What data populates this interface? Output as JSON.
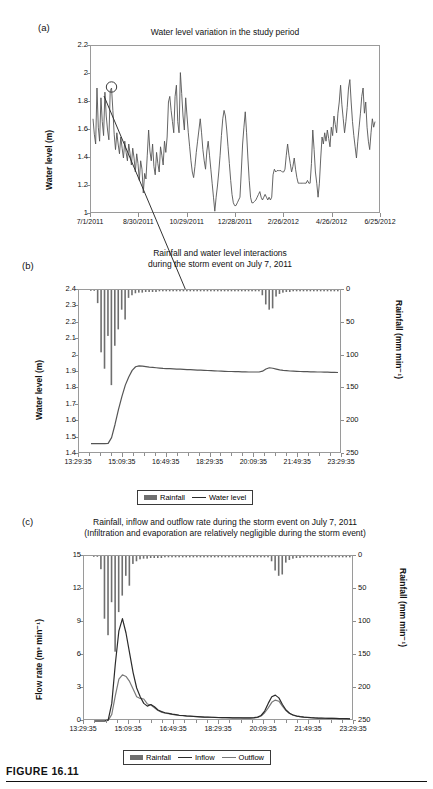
{
  "figure": {
    "caption": "FIGURE 16.11"
  },
  "panels": {
    "a": {
      "letter": "(a)",
      "title": "Water level variation in the study period",
      "ylabel": "Water level (m)",
      "yticks": [
        "1",
        "1.2",
        "1.4",
        "1.6",
        "1.8",
        "2",
        "2.2"
      ],
      "xticks": [
        "7/1/2011",
        "8/30/2011",
        "10/29/2011",
        "12/28/2011",
        "2/26/2012",
        "4/26/2012",
        "6/25/2012"
      ],
      "annotation": "circle-marker-highlight"
    },
    "b": {
      "letter": "(b)",
      "title_line1": "Rainfall and water level interactions",
      "title_line2": "during the storm event on July 7, 2011",
      "ylabel_left": "Water level (m)",
      "ylabel_right": "Rainfall (mm min⁻¹)",
      "yticks_left": [
        "1.4",
        "1.5",
        "1.6",
        "1.7",
        "1.8",
        "1.9",
        "2",
        "2.1",
        "2.2",
        "2.3",
        "2.4"
      ],
      "yticks_right": [
        "0",
        "50",
        "100",
        "150",
        "200",
        "250"
      ],
      "xticks": [
        "13:29:35",
        "15:09:35",
        "16:49:35",
        "18:29:35",
        "20:09:35",
        "21:49:35",
        "23:29:35"
      ],
      "legend": [
        "Rainfall",
        "Water level"
      ]
    },
    "c": {
      "letter": "(c)",
      "title_line1": "Rainfall, inflow and outflow rate during the storm event on July 7, 2011",
      "title_line2": "(Infiltration and evaporation are relatively negligible during the storm event)",
      "ylabel_left": "Flow rate (m³ min⁻¹)",
      "ylabel_right": "Rainfall (mm min⁻¹)",
      "yticks_left": [
        "0",
        "3",
        "6",
        "9",
        "12",
        "15"
      ],
      "yticks_right": [
        "0",
        "50",
        "100",
        "150",
        "200",
        "250"
      ],
      "xticks": [
        "13:29:35",
        "15:09:35",
        "16:49:35",
        "18:29:35",
        "20:09:35",
        "21:49:35",
        "23:29:35"
      ],
      "legend": [
        "Rainfall",
        "Inflow",
        "Outflow"
      ]
    }
  },
  "colors": {
    "series_line": "#555555",
    "rain_bar": "#6f6f6f",
    "inflow": "#2b2b2b",
    "outflow": "#7a7a7a",
    "axis": "#8d8d8d"
  },
  "chart_data": [
    {
      "type": "line",
      "panel": "a",
      "title": "Water level variation in the study period",
      "xlabel": "",
      "ylabel": "Water level (m)",
      "ylim": [
        1,
        2.2
      ],
      "yticks": [
        1,
        1.2,
        1.4,
        1.6,
        1.8,
        2,
        2.2
      ],
      "xtick_labels": [
        "7/1/2011",
        "8/30/2011",
        "10/29/2011",
        "12/28/2011",
        "2/26/2012",
        "4/26/2012",
        "6/25/2012"
      ],
      "grid": false,
      "legend": null,
      "series": [
        {
          "name": "Water level",
          "values": [
            1.68,
            1.57,
            1.5,
            1.9,
            1.62,
            1.52,
            1.83,
            1.66,
            1.56,
            1.87,
            1.7,
            1.6,
            1.53,
            1.88,
            1.9,
            1.74,
            1.57,
            1.46,
            1.58,
            1.5,
            1.43,
            1.55,
            1.47,
            1.4,
            1.52,
            1.44,
            1.38,
            1.5,
            1.43,
            1.35,
            1.47,
            1.4,
            1.3,
            1.43,
            1.36,
            1.24,
            1.38,
            1.32,
            1.15,
            1.29,
            1.25,
            1.42,
            1.6,
            1.45,
            1.38,
            1.5,
            1.34,
            1.28,
            1.44,
            1.36,
            1.3,
            1.48,
            1.42,
            1.35,
            1.52,
            1.44,
            1.55,
            1.8,
            1.84,
            1.74,
            1.66,
            1.58,
            1.84,
            1.92,
            1.66,
            1.58,
            2.01,
            1.86,
            1.7,
            1.6,
            1.83,
            1.7,
            1.58,
            1.48,
            1.38,
            1.3,
            1.26,
            1.34,
            1.44,
            1.52,
            1.6,
            1.68,
            1.58,
            1.46,
            1.38,
            1.32,
            1.45,
            1.52,
            1.42,
            1.32,
            1.22,
            1.12,
            1.02,
            1.12,
            1.2,
            1.3,
            1.42,
            1.56,
            1.68,
            1.74,
            1.7,
            1.6,
            1.48,
            1.36,
            1.24,
            1.14,
            1.08,
            1.06,
            1.06,
            1.08,
            1.1,
            1.12,
            1.3,
            1.5,
            1.62,
            1.73,
            1.58,
            1.4,
            1.24,
            1.12,
            1.08,
            1.08,
            1.09,
            1.1,
            1.12,
            1.14,
            1.16,
            1.12,
            1.1,
            1.12,
            1.14,
            1.12,
            1.1,
            1.12,
            1.1,
            1.12,
            1.28,
            1.32,
            1.3,
            1.31,
            1.31,
            1.31,
            1.31,
            1.3,
            1.3,
            1.32,
            1.42,
            1.5,
            1.42,
            1.36,
            1.3,
            1.34,
            1.4,
            1.32,
            1.26,
            1.22,
            1.22,
            1.22,
            1.22,
            1.22,
            1.22,
            1.22,
            1.24,
            1.22,
            1.22,
            1.36,
            1.6,
            1.46,
            1.3,
            1.22,
            1.12,
            1.22,
            1.4,
            1.55,
            1.5,
            1.58,
            1.52,
            1.6,
            1.54,
            1.48,
            1.62,
            1.56,
            1.7,
            1.64,
            1.58,
            1.72,
            1.8,
            1.92,
            1.78,
            1.68,
            1.58,
            1.66,
            1.76,
            1.9,
            1.96,
            1.8,
            1.66,
            1.56,
            1.48,
            1.4,
            1.52,
            1.62,
            1.72,
            1.84,
            1.9,
            1.72,
            1.8,
            1.62,
            1.52,
            1.46,
            1.58,
            1.68,
            1.62,
            1.66
          ]
        }
      ],
      "annotations": [
        {
          "type": "circle",
          "label": "storm event July 7, 2011",
          "x_index": 14,
          "y": 1.9
        },
        {
          "type": "arrow",
          "from_panel": "a",
          "to_panel": "b",
          "note": "points to water level rise in panel b"
        }
      ]
    },
    {
      "type": "line",
      "panel": "b",
      "title": "Rainfall and water level interactions during the storm event on July 7, 2011",
      "xlabel": "",
      "ylabel": "Water level (m)",
      "ylabel_secondary": "Rainfall (mm min⁻¹)",
      "ylim": [
        1.4,
        2.4
      ],
      "ylim_secondary": [
        250,
        0
      ],
      "yticks": [
        1.4,
        1.5,
        1.6,
        1.7,
        1.8,
        1.9,
        2.0,
        2.1,
        2.2,
        2.3,
        2.4
      ],
      "yticks_secondary": [
        0,
        50,
        100,
        150,
        200,
        250
      ],
      "xtick_labels": [
        "13:29:35",
        "15:09:35",
        "16:49:35",
        "18:29:35",
        "20:09:35",
        "21:49:35",
        "23:29:35"
      ],
      "grid": false,
      "legend": [
        "Rainfall",
        "Water level"
      ],
      "legend_position": "below",
      "series": [
        {
          "name": "Water level",
          "axis": "left",
          "values": [
            1.463,
            1.463,
            1.463,
            1.463,
            1.463,
            1.465,
            1.5,
            1.58,
            1.67,
            1.75,
            1.82,
            1.87,
            1.91,
            1.932,
            1.937,
            1.936,
            1.933,
            1.93,
            1.928,
            1.926,
            1.924,
            1.922,
            1.921,
            1.92,
            1.919,
            1.918,
            1.917,
            1.916,
            1.915,
            1.914,
            1.913,
            1.912,
            1.911,
            1.91,
            1.909,
            1.908,
            1.907,
            1.906,
            1.905,
            1.904,
            1.903,
            1.903,
            1.902,
            1.902,
            1.901,
            1.901,
            1.9,
            1.9,
            1.9,
            1.9,
            1.905,
            1.918,
            1.926,
            1.923,
            1.918,
            1.913,
            1.91,
            1.908,
            1.906,
            1.905,
            1.904,
            1.903,
            1.902,
            1.902,
            1.901,
            1.901,
            1.9,
            1.9,
            1.899,
            1.899,
            1.898,
            1.898,
            1.897
          ]
        },
        {
          "name": "Rainfall",
          "axis": "right",
          "values": [
            0,
            0,
            20,
            95,
            120,
            70,
            145,
            85,
            60,
            30,
            45,
            12,
            8,
            5,
            4,
            4,
            3,
            3,
            3,
            3,
            2,
            2,
            2,
            2,
            2,
            2,
            2,
            2,
            2,
            2,
            2,
            2,
            2,
            2,
            2,
            2,
            2,
            2,
            2,
            2,
            2,
            2,
            2,
            2,
            2,
            2,
            2,
            2,
            2,
            2,
            8,
            22,
            30,
            28,
            10,
            6,
            4,
            3,
            3,
            2,
            2,
            2,
            2,
            2,
            2,
            2,
            2,
            2,
            2,
            2,
            2,
            2,
            2
          ]
        }
      ],
      "annotations": [
        {
          "type": "arrow",
          "note": "from panel (a) circle down to rising limb of water level"
        }
      ]
    },
    {
      "type": "line",
      "panel": "c",
      "title": "Rainfall, inflow and outflow rate during the storm event on July 7, 2011",
      "subtitle": "(Infiltration and evaporation are relatively negligible during the storm event)",
      "xlabel": "",
      "ylabel": "Flow rate (m³ min⁻¹)",
      "ylabel_secondary": "Rainfall (mm min⁻¹)",
      "ylim": [
        0,
        15
      ],
      "ylim_secondary": [
        250,
        0
      ],
      "yticks": [
        0,
        3,
        6,
        9,
        12,
        15
      ],
      "yticks_secondary": [
        0,
        50,
        100,
        150,
        200,
        250
      ],
      "xtick_labels": [
        "13:29:35",
        "15:09:35",
        "16:49:35",
        "18:29:35",
        "20:09:35",
        "21:49:35",
        "23:29:35"
      ],
      "grid": false,
      "legend": [
        "Rainfall",
        "Inflow",
        "Outflow"
      ],
      "legend_position": "below",
      "series": [
        {
          "name": "Inflow",
          "axis": "left",
          "values": [
            0,
            0,
            0,
            0,
            0.1,
            1.6,
            5.2,
            8.2,
            9.3,
            8.0,
            6.2,
            4.4,
            3.0,
            2.2,
            1.6,
            1.35,
            1.5,
            1.3,
            1.0,
            0.85,
            0.75,
            0.7,
            0.62,
            0.58,
            0.52,
            0.5,
            0.46,
            0.44,
            0.42,
            0.4,
            0.38,
            0.36,
            0.35,
            0.34,
            0.33,
            0.32,
            0.31,
            0.3,
            0.3,
            0.29,
            0.29,
            0.28,
            0.28,
            0.28,
            0.28,
            0.3,
            0.35,
            0.5,
            0.9,
            1.6,
            2.2,
            2.35,
            2.1,
            1.5,
            1.0,
            0.7,
            0.55,
            0.45,
            0.4,
            0.36,
            0.33,
            0.3,
            0.28,
            0.27,
            0.26,
            0.25,
            0.24,
            0.24,
            0.23,
            0.22,
            0.22,
            0.21,
            0.2
          ]
        },
        {
          "name": "Outflow",
          "axis": "left",
          "values": [
            0,
            0,
            0,
            0,
            0.05,
            0.6,
            2.3,
            3.8,
            4.2,
            4.05,
            3.6,
            2.9,
            2.2,
            2.05,
            2.0,
            1.55,
            1.45,
            1.2,
            0.95,
            0.8,
            0.72,
            0.66,
            0.6,
            0.55,
            0.5,
            0.48,
            0.45,
            0.43,
            0.41,
            0.39,
            0.37,
            0.35,
            0.34,
            0.33,
            0.32,
            0.31,
            0.3,
            0.3,
            0.29,
            0.29,
            0.28,
            0.28,
            0.27,
            0.27,
            0.27,
            0.28,
            0.32,
            0.45,
            0.75,
            1.2,
            1.7,
            1.9,
            1.8,
            1.35,
            0.95,
            0.68,
            0.53,
            0.44,
            0.39,
            0.35,
            0.32,
            0.3,
            0.28,
            0.26,
            0.25,
            0.24,
            0.24,
            0.23,
            0.22,
            0.22,
            0.21,
            0.2,
            0.2
          ]
        },
        {
          "name": "Rainfall",
          "axis": "right",
          "values": [
            0,
            0,
            20,
            95,
            120,
            70,
            145,
            85,
            60,
            30,
            45,
            12,
            8,
            5,
            4,
            4,
            3,
            3,
            3,
            3,
            2,
            2,
            2,
            2,
            2,
            2,
            2,
            2,
            2,
            2,
            2,
            2,
            2,
            2,
            2,
            2,
            2,
            2,
            2,
            2,
            2,
            2,
            2,
            2,
            2,
            2,
            2,
            2,
            2,
            2,
            8,
            22,
            30,
            28,
            10,
            6,
            4,
            3,
            3,
            2,
            2,
            2,
            2,
            2,
            2,
            2,
            2,
            2,
            2,
            2,
            2,
            2,
            2
          ]
        }
      ]
    }
  ]
}
